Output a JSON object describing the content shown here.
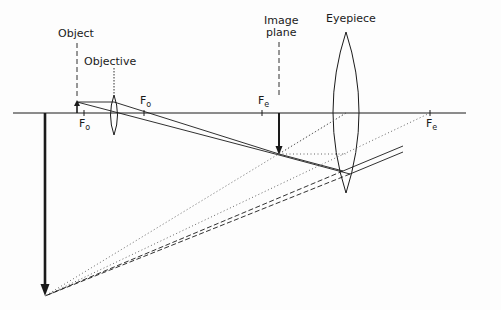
{
  "labels": {
    "object": "Object",
    "objective": "Objective",
    "image_plane_line1": "Image",
    "image_plane_line2": "plane",
    "eyepiece": "Eyepiece"
  },
  "focal_points": {
    "objective_left": {
      "base": "F",
      "sub": "o"
    },
    "objective_right": {
      "base": "F",
      "sub": "o"
    },
    "eyepiece_left": {
      "base": "F",
      "sub": "e"
    },
    "eyepiece_right": {
      "base": "F",
      "sub": "e"
    }
  },
  "colors": {
    "ink": "#1a1a1a",
    "background": "#fdfdfd"
  }
}
